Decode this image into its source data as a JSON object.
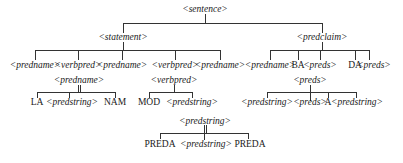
{
  "diagram": {
    "type": "parse-tree",
    "colors": {
      "line": "#333333",
      "text": "#1a1a1a",
      "background": "#ffffff"
    },
    "nodes": {
      "sentence": {
        "label": "<sentence>"
      },
      "statement": {
        "label": "<statement>"
      },
      "predclaim": {
        "label": "<predclaim>"
      },
      "st_c1": {
        "label": "<predname>"
      },
      "st_c2": {
        "label": "<verbpred>"
      },
      "st_c3": {
        "label": "<predname>"
      },
      "st_c4": {
        "label": "<verbpred>"
      },
      "st_c5": {
        "label": "<predname>"
      },
      "pc_c1": {
        "label": "<predname>"
      },
      "pc_c2": {
        "label": "BA"
      },
      "pc_c3": {
        "label": "<preds>"
      },
      "pc_c4": {
        "label": "DA"
      },
      "pc_c5": {
        "label": "<preds>"
      },
      "pn_root": {
        "label": "<predname>"
      },
      "pn_c1": {
        "label": "LA"
      },
      "pn_c2": {
        "label": "<predstring>"
      },
      "pn_c3": {
        "label": "NAM"
      },
      "vp_root": {
        "label": "<verbpred>"
      },
      "vp_c1": {
        "label": "MOD"
      },
      "vp_c2": {
        "label": "<predstring>"
      },
      "pr_root": {
        "label": "<preds>"
      },
      "pr_c1": {
        "label": "<predstring>"
      },
      "pr_c2": {
        "label": "<preds>"
      },
      "pr_c3": {
        "label": "A"
      },
      "pr_c4": {
        "label": "<predstring>"
      },
      "ps_root": {
        "label": "<predstring>"
      },
      "ps_c1": {
        "label": "PREDA"
      },
      "ps_c2": {
        "label": "<predstring>"
      },
      "ps_c3": {
        "label": "PREDA"
      }
    }
  }
}
